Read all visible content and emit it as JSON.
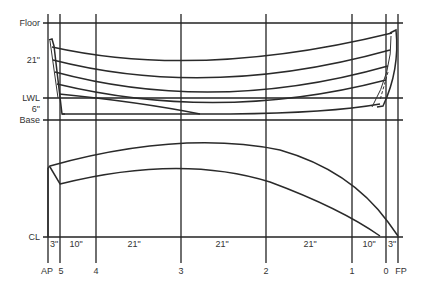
{
  "diagram": {
    "horizontal_labels": {
      "floor": "Floor",
      "spacing_top": "21\"",
      "lwl": "LWL",
      "spacing_low": "6\"",
      "base": "Base",
      "cl": "CL"
    },
    "station_labels": {
      "ap": "AP",
      "s5": "5",
      "s4": "4",
      "s3": "3",
      "s2": "2",
      "s1": "1",
      "s0": "0",
      "fp": "FP"
    },
    "spacing_labels": {
      "ap_5": "3\"",
      "s5_4": "10\"",
      "s4_3": "21\"",
      "s3_2": "21\"",
      "s2_1": "21\"",
      "s1_0": "10\"",
      "s0_fp": "3\""
    },
    "colors": {
      "line": "#222222",
      "text": "#333333",
      "background": "#ffffff"
    }
  }
}
